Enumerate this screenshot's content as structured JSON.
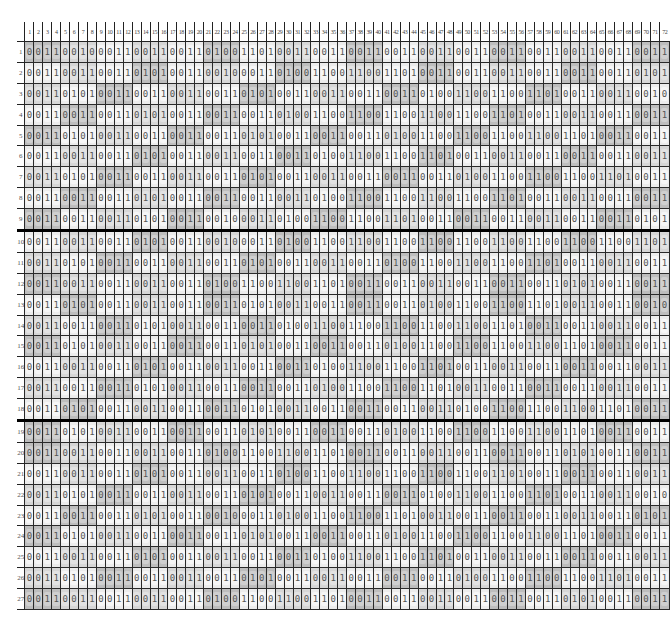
{
  "grid": {
    "columns": 72,
    "rows": 27,
    "column_headers": [
      "1",
      "2",
      "3",
      "4",
      "5",
      "6",
      "7",
      "8",
      "9",
      "10",
      "11",
      "12",
      "13",
      "14",
      "15",
      "16",
      "17",
      "18",
      "19",
      "20",
      "21",
      "22",
      "23",
      "24",
      "25",
      "26",
      "27",
      "28",
      "29",
      "30",
      "31",
      "32",
      "33",
      "34",
      "35",
      "36",
      "37",
      "38",
      "39",
      "40",
      "41",
      "42",
      "43",
      "44",
      "45",
      "46",
      "47",
      "48",
      "49",
      "50",
      "51",
      "52",
      "53",
      "54",
      "55",
      "56",
      "57",
      "58",
      "59",
      "60",
      "61",
      "62",
      "63",
      "64",
      "65",
      "66",
      "67",
      "68",
      "69",
      "70",
      "71",
      "72"
    ],
    "row_headers": [
      "1",
      "2",
      "3",
      "4",
      "5",
      "6",
      "7",
      "8",
      "9",
      "10",
      "11",
      "12",
      "13",
      "14",
      "15",
      "16",
      "17",
      "18",
      "19",
      "20",
      "21",
      "22",
      "23",
      "24",
      "25",
      "26",
      "27"
    ],
    "section_breaks_after_rows": [
      9,
      18
    ],
    "colors": {
      "grid_line": "#2a2a2a",
      "thick_line": "#000000",
      "cell_light": "#ececec",
      "cell_mid": "#d6d6d6",
      "cell_dark": "#bdbdbd",
      "digit": "#555555"
    },
    "bits": [
      "001100100011001100110100110100110011001100110011001100110011001100110011",
      "001100110011010100110010001101001100110011010011001100110011001100110101",
      "001101010011001100110011010100110011001100110100110011001101001100110010",
      "001100110011010100110011001101001100110011001100110011010011001100110011",
      "001101010011001100110011010100110011001101001100110011001100110100110011",
      "001100110011010100110011001100110100110011001101001100110011001100110011",
      "001101010011001100110011010100110011001100110011010011001100110011010011",
      "001100110011010100110011001100110100110011001100110011010011001100110011",
      "001100110011010100110010001101001100110011010011001100110011001100110101",
      "001100110011010100110010001101001100110011001100110011001100110011001101",
      "001101010011001100110011010100110011001101001100110011001101001100110011",
      "001100110011001100110100110011001101001100110011001100110011010100110011",
      "001101010011001100110011010100110011001100110100110011001101001100110010",
      "001100110011010100110011001101001100110011001100110011010011001100110011",
      "001101010011001100110011010100110011001101001100110011001100110100110011",
      "001100110011010100110011001100110100110011001101001100110011001100110011",
      "001100110011010100110011001100110100110011001101001100110011001100110011",
      "001101010011001100110011010100110011001100110011010011001100110011010011",
      "001101010011001100110011010100110011001101001100110011001100110100110011",
      "001100110011001100110100110011001101001100110011001100110011010100110011",
      "001100110011010100110011001101001100110011001100110011010011001100110011",
      "001101010011001100110011010100110011001100110100110011001101001100110010",
      "001100110011010100110010001101001100110011010011001100110011001100110101",
      "001101010011001100110011010100110011001101001100110011001100110100110011",
      "001100110011010100110011001100110100110011001101001100110011001100110011",
      "001101010011001100110011010100110011001100110011010011001100110011010011",
      "001100110011001100110100110011001101001100110011001100110011010100110011"
    ],
    "shading": [
      "DDDDMMMMLLLLMMMMLLLLDDDDLLLLMMMMLLLLDDDDLLLLMMMMLLLLDDDDLLLLMMMMLLLLDDDD",
      "LLLLMMMMLLLLDDDDLLLLMMMMLLLLDDDDLLLLMMMMLLLLDDDDLLLLMMMMLLLLDDDDLLLLMMMM",
      "MMMMLLLLDDDDLLLLMMMMLLLLDDDDLLLLMMMMLLLLDDDDLLLLMMMMLLLLDDDDLLLLMMMMLLLL",
      "LLLLDDDDLLLLMMMMLLLLDDDDLLLLMMMMLLLLDDDDLLLLMMMMLLLLDDDDLLLLMMMMLLLLDDDD",
      "DDDDLLLLMMMMLLLLDDDDLLLLMMMMLLLLDDDDLLLLMMMMLLLLDDDDLLLLMMMMLLLLDDDDLLLL",
      "LLLLMMMMLLLLDDDDLLLLMMMMLLLLDDDDLLLLMMMMLLLLDDDDLLLLMMMMLLLLDDDDLLLLMMMM",
      "MMMMLLLLDDDDLLLLMMMMLLLLDDDDLLLLMMMMLLLLDDDDLLLLMMMMLLLLDDDDLLLLMMMMLLLL",
      "LLLLDDDDLLLLMMMMLLLLDDDDLLLLMMMMLLLLDDDDLLLLMMMMLLLLDDDDLLLLMMMMLLLLDDDD",
      "DDDDLLLLMMMMLLLLDDDDLLLLMMMMLLLLDDDDLLLLMMMMLLLLDDDDLLLLMMMMLLLLDDDDLLLL",
      "LLLLMMMMLLLLDDDDLLLLMMMMLLLLDDDDLLLLMMMMLLLLDDDDLLLLMMMMLLLLDDDDLLLLMMMM",
      "MMMMLLLLDDDDLLLLMMMMLLLLDDDDLLLLMMMMLLLLDDDDLLLLMMMMLLLLDDDDLLLLMMMMLLLL",
      "DDDDMMMMLLLLMMMMLLLLDDDDLLLLMMMMLLLLDDDDLLLLMMMMLLLLDDDDLLLLMMMMLLLLDDDD",
      "LLLLDDDDLLLLMMMMLLLLDDDDLLLLMMMMLLLLDDDDLLLLMMMMLLLLDDDDLLLLMMMMLLLLDDDD",
      "MMMMLLLLDDDDLLLLMMMMLLLLDDDDLLLLMMMMLLLLDDDDLLLLMMMMLLLLDDDDLLLLMMMMLLLL",
      "DDDDLLLLMMMMLLLLDDDDLLLLMMMMLLLLDDDDLLLLMMMMLLLLDDDDLLLLMMMMLLLLDDDDLLLL",
      "LLLLMMMMLLLLDDDDLLLLMMMMLLLLDDDDLLLLMMMMLLLLDDDDLLLLMMMMLLLLDDDDLLLLMMMM",
      "MMMMLLLLDDDDLLLLMMMMLLLLDDDDLLLLMMMMLLLLDDDDLLLLMMMMLLLLDDDDLLLLMMMMLLLL",
      "LLLLDDDDLLLLMMMMLLLLDDDDLLLLMMMMLLLLDDDDLLLLMMMMLLLLDDDDLLLLMMMMLLLLDDDD",
      "DDDDLLLLMMMMLLLLDDDDLLLLMMMMLLLLDDDDLLLLMMMMLLLLDDDDLLLLMMMMLLLLDDDDLLLL",
      "DDDDMMMMLLLLMMMMLLLLDDDDLLLLMMMMLLLLDDDDLLLLMMMMLLLLDDDDLLLLMMMMLLLLDDDD",
      "LLLLMMMMLLLLDDDDLLLLMMMMLLLLDDDDLLLLMMMMLLLLDDDDLLLLMMMMLLLLDDDDLLLLMMMM",
      "MMMMLLLLDDDDLLLLMMMMLLLLDDDDLLLLMMMMLLLLDDDDLLLLMMMMLLLLDDDDLLLLMMMMLLLL",
      "LLLLDDDDLLLLMMMMLLLLDDDDLLLLMMMMLLLLDDDDLLLLMMMMLLLLDDDDLLLLMMMMLLLLDDDD",
      "DDDDLLLLMMMMLLLLDDDDLLLLMMMMLLLLDDDDLLLLMMMMLLLLDDDDLLLLMMMMLLLLDDDDLLLL",
      "LLLLMMMMLLLLDDDDLLLLMMMMLLLLDDDDLLLLMMMMLLLLDDDDLLLLMMMMLLLLDDDDLLLLMMMM",
      "MMMMLLLLDDDDLLLLMMMMLLLLDDDDLLLLMMMMLLLLDDDDLLLLMMMMLLLLDDDDLLLLMMMMLLLL",
      "DDDDMMMMLLLLMMMMLLLLDDDDLLLLMMMMLLLLDDDDLLLLMMMMLLLLDDDDLLLLMMMMLLLLDDDD"
    ]
  }
}
